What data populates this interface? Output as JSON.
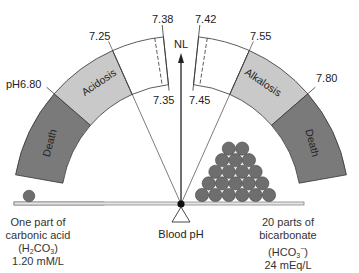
{
  "diagram": {
    "pivot_label": "Blood pH",
    "normal_label": "NL",
    "zones": {
      "left_death": "Death",
      "acidosis": "Acidosis",
      "alkalosis": "Alkalosis",
      "right_death": "Death"
    },
    "scale_labels": {
      "ph_680": "pH6.80",
      "ph_725": "7.25",
      "ph_738": "7.38",
      "ph_735": "7.35",
      "ph_742": "7.42",
      "ph_745": "7.45",
      "ph_755": "7.55",
      "ph_780": "7.80"
    },
    "left_caption": {
      "line1": "One part of",
      "line2": "carbonic acid",
      "formula_open": "(H",
      "formula_sub1": "2",
      "formula_mid": "CO",
      "formula_sub2": "3",
      "formula_close": ")",
      "value": "1.20 mM/L"
    },
    "right_caption": {
      "line1": "20 parts of",
      "line2": "bicarbonate",
      "formula_open": "(HCO",
      "formula_sub": "3",
      "formula_sup": "−",
      "formula_close": ")",
      "value": "24 mEq/L"
    },
    "counts": {
      "acid_parts": 1,
      "bicarbonate_parts": 20,
      "pyramid_rows": [
        2,
        3,
        4,
        5,
        6
      ]
    },
    "colors": {
      "death": "#7a7a7a",
      "disease": "#c9c9c9",
      "normal": "#ffffff",
      "ball": "#6e6e6e",
      "outline": "#333333"
    }
  }
}
